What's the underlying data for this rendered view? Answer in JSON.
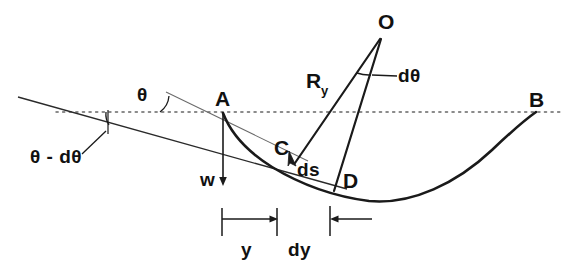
{
  "figure": {
    "type": "geometry-diagram",
    "background_color": "#ffffff",
    "stroke_color": "#1a1a1a",
    "thin_stroke_color": "#555555",
    "dotted_line_color": "#666666",
    "width": 566,
    "height": 274
  },
  "labels": {
    "point_o": "O",
    "point_a": "A",
    "point_b": "B",
    "point_c": "C",
    "point_d": "D",
    "radius": "R",
    "radius_sub": "y",
    "d_theta": "dθ",
    "theta": "θ",
    "theta_minus_dtheta": "θ - dθ",
    "weight": "w",
    "arc_length": "ds",
    "dim_y": "y",
    "dim_dy": "dy"
  },
  "elements": {
    "horizontal_datum": {
      "name": "horizontal-dotted-datum-line",
      "style": "dotted",
      "y": 112,
      "x_start": 56,
      "x_end": 560
    },
    "catenary_curve": {
      "name": "catenary-curve",
      "from": "A",
      "through": [
        "C",
        "D"
      ],
      "to": "B",
      "lowest_y": 201
    },
    "tangent_line_lower": {
      "name": "tangent-line-theta-minus-dtheta",
      "x_start": 18,
      "y_start": 97,
      "x_end": 345,
      "y_end": 188
    },
    "tangent_line_upper": {
      "name": "tangent-line-theta",
      "x_start": 165,
      "y_start": 93,
      "x_end": 305,
      "y_end": 160
    },
    "radius_line_c": {
      "name": "radius-line-o-to-c",
      "from_x": 380,
      "from_y": 38,
      "to_x": 296,
      "to_y": 162
    },
    "radius_line_d": {
      "name": "radius-line-o-to-d",
      "from_x": 380,
      "from_y": 38,
      "to_x": 333,
      "to_y": 190
    },
    "weight_arrow": {
      "name": "weight-vector-arrow",
      "x": 223,
      "y_start": 113,
      "y_end": 184,
      "direction": "down"
    },
    "dimension_y": {
      "name": "dimension-y",
      "x_start": 222,
      "x_end": 277,
      "y": 219,
      "arrow": "right"
    },
    "dimension_dy": {
      "name": "dimension-dy",
      "x_start": 330,
      "x_end": 370,
      "y": 219,
      "arrow": "left"
    },
    "angle_arc_theta": {
      "name": "angle-arc-theta",
      "cx": 171,
      "cy": 112
    },
    "angle_arc_theta_minus": {
      "name": "angle-arc-theta-minus-dtheta",
      "cx": 110,
      "cy": 128
    },
    "angle_arc_dtheta": {
      "name": "angle-arc-dtheta",
      "cx": 380,
      "cy": 38
    }
  }
}
